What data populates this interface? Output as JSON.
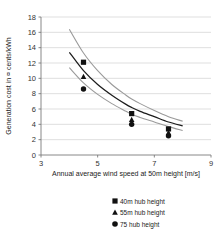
{
  "chart_data": {
    "type": "line",
    "title": "",
    "xlabel": "Annual average wind speed at 50m height [m/s]",
    "ylabel": "Generation cost in ¤ cents/kWh",
    "xlim": [
      3,
      9
    ],
    "ylim": [
      0,
      18
    ],
    "xticks": [
      3,
      5,
      7,
      9
    ],
    "yticks": [
      0,
      2,
      4,
      6,
      8,
      10,
      12,
      14,
      16,
      18
    ],
    "grid": true,
    "legend_position": "bottom",
    "series": [
      {
        "name": "40m hub height",
        "marker": "square",
        "color": "#111111",
        "curve_color": "#9a9a9a",
        "x": [
          4.0,
          4.5,
          5.0,
          5.5,
          6.0,
          6.2,
          6.5,
          7.0,
          7.5,
          8.0
        ],
        "y": [
          16.4,
          13.3,
          11.0,
          9.2,
          7.8,
          7.3,
          6.7,
          5.8,
          5.0,
          4.4
        ],
        "points": [
          {
            "x": 4.5,
            "y": 12.1
          },
          {
            "x": 6.2,
            "y": 5.4
          },
          {
            "x": 7.5,
            "y": 3.4
          }
        ]
      },
      {
        "name": "55m hub height",
        "marker": "triangle",
        "color": "#111111",
        "curve_color": "#1c1c1c",
        "x": [
          4.0,
          4.5,
          5.0,
          5.5,
          6.0,
          6.2,
          6.5,
          7.0,
          7.5,
          8.0
        ],
        "y": [
          13.4,
          11.0,
          9.2,
          7.8,
          6.6,
          6.2,
          5.7,
          5.0,
          4.3,
          3.8
        ],
        "points": [
          {
            "x": 4.5,
            "y": 10.2
          },
          {
            "x": 6.2,
            "y": 4.6
          },
          {
            "x": 7.5,
            "y": 2.9
          }
        ]
      },
      {
        "name": "75 hub height",
        "marker": "circle",
        "color": "#111111",
        "curve_color": "#9a9a9a",
        "x": [
          4.0,
          4.5,
          5.0,
          5.5,
          6.0,
          6.2,
          6.5,
          7.0,
          7.5,
          8.0
        ],
        "y": [
          11.4,
          9.4,
          7.9,
          6.7,
          5.7,
          5.3,
          4.9,
          4.3,
          3.7,
          3.2
        ],
        "points": [
          {
            "x": 4.5,
            "y": 8.6
          },
          {
            "x": 6.2,
            "y": 4.0
          },
          {
            "x": 7.5,
            "y": 2.5
          }
        ]
      }
    ]
  },
  "legend": {
    "items": [
      {
        "label": "40m hub height",
        "marker": "square"
      },
      {
        "label": "55m hub height",
        "marker": "triangle"
      },
      {
        "label": "75 hub height",
        "marker": "circle"
      }
    ]
  }
}
